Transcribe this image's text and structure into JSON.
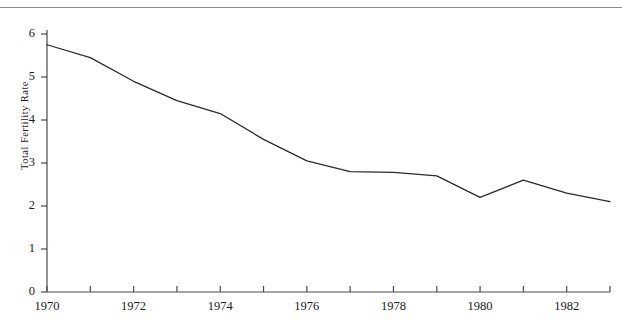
{
  "figure": {
    "cropped_header_text": "",
    "y_axis_title": "Total Fertility Rate"
  },
  "axis": {
    "y_ticks": [
      "0",
      "1",
      "2",
      "3",
      "4",
      "5",
      "6"
    ],
    "x_ticks": [
      "1970",
      "1972",
      "1974",
      "1976",
      "1978",
      "1982"
    ],
    "x_tick_1980": "1980"
  },
  "colors": {
    "line": "#2b2b2b",
    "axis": "#4a4a4a",
    "rule": "#8d8d8d",
    "text": "#1b1b1b",
    "background": "#ffffff"
  },
  "chart_data": {
    "type": "line",
    "title": "",
    "xlabel": "",
    "ylabel": "Total Fertility Rate",
    "xlim": [
      1970,
      1983
    ],
    "ylim": [
      0,
      6
    ],
    "grid": false,
    "legend": null,
    "x": [
      1970,
      1971,
      1972,
      1973,
      1974,
      1975,
      1976,
      1977,
      1978,
      1979,
      1980,
      1981,
      1982,
      1983
    ],
    "xtick_values": [
      1970,
      1971,
      1972,
      1973,
      1974,
      1975,
      1976,
      1977,
      1978,
      1979,
      1980,
      1981,
      1982,
      1983
    ],
    "xtick_labels": [
      "1970",
      "",
      "1972",
      "",
      "1974",
      "",
      "1976",
      "",
      "1978",
      "",
      "1980",
      "",
      "1982",
      ""
    ],
    "ytick_values": [
      0,
      1,
      2,
      3,
      4,
      5,
      6
    ],
    "series": [
      {
        "name": "Total Fertility Rate",
        "values": [
          5.75,
          5.45,
          4.9,
          4.45,
          4.15,
          3.55,
          3.05,
          2.8,
          2.78,
          2.7,
          2.2,
          2.6,
          2.3,
          2.1
        ]
      }
    ]
  }
}
